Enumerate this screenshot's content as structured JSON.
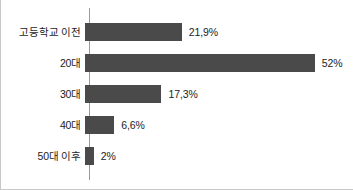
{
  "chart_data": {
    "type": "bar",
    "orientation": "horizontal",
    "title": "",
    "subtitle": "",
    "xlabel": "",
    "ylabel": "",
    "xlim": [
      0,
      60
    ],
    "grid": false,
    "legend": false,
    "categories": [
      "고등학교 이전",
      "20대",
      "30대",
      "40대",
      "50대 이후"
    ],
    "values": [
      21.9,
      52,
      17.3,
      6.6,
      2
    ],
    "value_labels": [
      "21,9%",
      "52%",
      "17,3%",
      "6,6%",
      "2%"
    ],
    "bar_color": "#4a4a4a",
    "axis_color": "#9a9a9a",
    "frame_color": "#c8c8c8",
    "text_color": "#1c1c1c",
    "bars": [
      {
        "category": "고등학교 이전",
        "value": 21.9,
        "label": "21,9%"
      },
      {
        "category": "20대",
        "value": 52,
        "label": "52%"
      },
      {
        "category": "30대",
        "value": 17.3,
        "label": "17,3%"
      },
      {
        "category": "40대",
        "value": 6.6,
        "label": "6,6%"
      },
      {
        "category": "50대 이후",
        "value": 2,
        "label": "2%"
      }
    ]
  }
}
